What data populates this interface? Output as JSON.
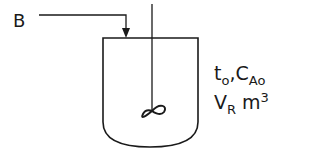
{
  "diagram": {
    "type": "semi-batch stirred tank reactor",
    "feed_stream": {
      "label": "B"
    },
    "reactor": {
      "initial_time": {
        "main": "t",
        "sub": "o"
      },
      "separator": ",",
      "initial_concentration": {
        "main": "C",
        "sub": "A",
        "sub2": "o"
      },
      "volume": {
        "main": "V",
        "sub": "R",
        "unit_main": "m",
        "unit_sup": "3"
      }
    },
    "agitator_icon": "impeller-icon",
    "colors": {
      "line": "#1a1a1a",
      "background": "#ffffff"
    }
  }
}
